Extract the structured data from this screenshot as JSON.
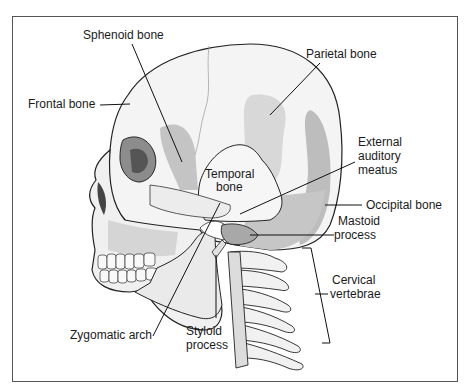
{
  "figure": {
    "type": "anatomical-diagram",
    "labels": {
      "sphenoid": "Sphenoid bone",
      "frontal": "Frontal bone",
      "parietal": "Parietal bone",
      "temporal_1": "Temporal",
      "temporal_2": "bone",
      "ext_aud_1": "External",
      "ext_aud_2": "auditory",
      "ext_aud_3": "meatus",
      "occipital": "Occipital bone",
      "mastoid_1": "Mastoid",
      "mastoid_2": "process",
      "cervical_1": "Cervical",
      "cervical_2": "vertebrae",
      "zygomatic": "Zygomatic arch",
      "styloid_1": "Styloid",
      "styloid_2": "process"
    },
    "colors": {
      "bone_light": "#f2f2f2",
      "bone_mid": "#c8c8c8",
      "bone_dark": "#8a8a8a",
      "outline": "#222222",
      "frame": "#555555"
    }
  }
}
